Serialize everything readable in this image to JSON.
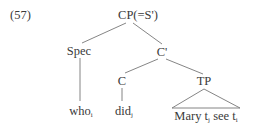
{
  "example_number": "(57)",
  "tree": {
    "root": {
      "label": "CP(=S')"
    },
    "spec": {
      "label": "Spec",
      "leaf": {
        "word": "who",
        "index": "i"
      }
    },
    "cbar": {
      "label": "C'"
    },
    "c": {
      "label": "C",
      "leaf": {
        "word": "did",
        "index": "j"
      }
    },
    "tp": {
      "label": "TP",
      "leaf_parts": [
        {
          "word": "Mary t",
          "index": "j"
        },
        {
          "word": " see t",
          "index": "i"
        }
      ]
    }
  },
  "edges": [
    {
      "from": "CP(=S')",
      "to": "Spec",
      "style": "line"
    },
    {
      "from": "CP(=S')",
      "to": "C'",
      "style": "line"
    },
    {
      "from": "Spec",
      "to": "who_i",
      "style": "line"
    },
    {
      "from": "C'",
      "to": "C",
      "style": "line"
    },
    {
      "from": "C'",
      "to": "TP",
      "style": "line"
    },
    {
      "from": "C",
      "to": "did_j",
      "style": "line"
    },
    {
      "from": "TP",
      "to": "Mary t_j see t_i",
      "style": "triangle"
    }
  ]
}
